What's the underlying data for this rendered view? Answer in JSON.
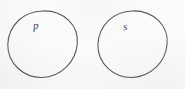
{
  "figure": {
    "background_color": "#fbfbfa",
    "stroke_color": "#4a4a4a",
    "label_color": "#3f3f3f",
    "width": 185,
    "height": 89,
    "style": "hand-drawn pen sketch on paper"
  },
  "shapes": [
    {
      "id": "circle-p",
      "kind": "circle",
      "label": "p",
      "center_x": 42.5,
      "center_y": 45.5,
      "radius": 34.5,
      "label_x": 36,
      "label_y": 25
    },
    {
      "id": "circle-s",
      "kind": "circle",
      "label": "s",
      "center_x": 132.5,
      "center_y": 45.5,
      "radius": 34.5,
      "label_x": 126,
      "label_y": 26
    }
  ],
  "labels": {
    "left_circle": "p",
    "right_circle": "s"
  }
}
